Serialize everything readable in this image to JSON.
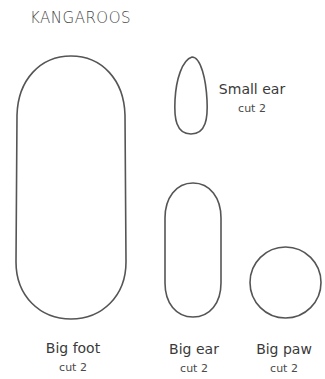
{
  "title": "KANGAROOS",
  "colors": {
    "outline": "#555555",
    "text": "#3a3a3a",
    "background": "#ffffff"
  },
  "pieces": [
    {
      "id": "small-ear",
      "name": "Small ear",
      "cut": "cut 2",
      "shape": "teardrop"
    },
    {
      "id": "big-foot",
      "name": "Big foot",
      "cut": "cut 2",
      "shape": "stadium"
    },
    {
      "id": "big-ear",
      "name": "Big ear",
      "cut": "cut 2",
      "shape": "stadium"
    },
    {
      "id": "big-paw",
      "name": "Big paw",
      "cut": "cut 2",
      "shape": "circle"
    }
  ]
}
